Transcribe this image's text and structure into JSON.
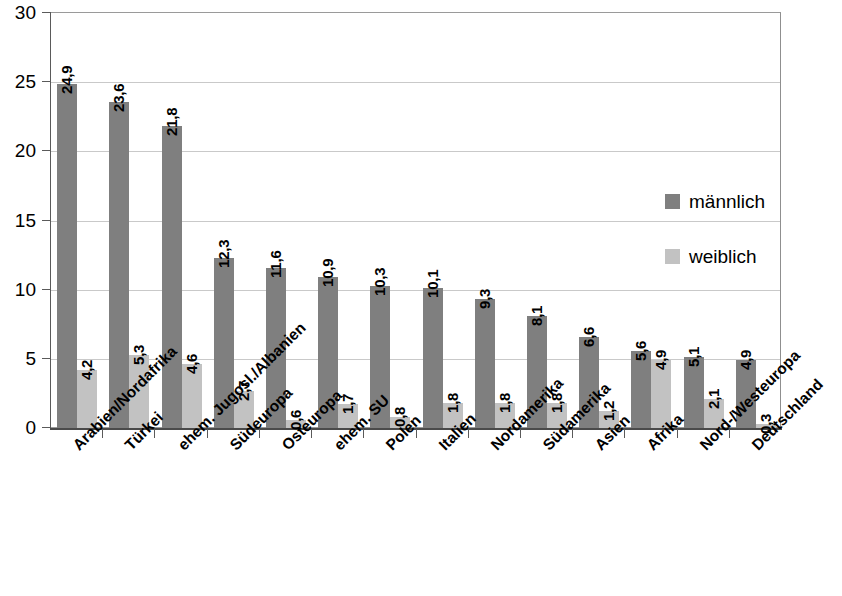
{
  "chart_data": {
    "type": "bar",
    "title": "",
    "subtitle": "",
    "xlabel": "",
    "ylabel": "",
    "ylim": [
      0,
      30
    ],
    "ytick_step": 5,
    "yticks": [
      "0",
      "5",
      "10",
      "15",
      "20",
      "25",
      "30"
    ],
    "grid": true,
    "legend_position": "inside-right",
    "decimal_separator": ",",
    "categories": [
      "Arabien/Nordafrika",
      "Türkei",
      "ehem. Jugosl./Albanien",
      "Südeuropa",
      "Osteuropa",
      "ehem. SU",
      "Polen",
      "Italien",
      "Nordamerika",
      "Südamerika",
      "Asien",
      "Afrika",
      "Nord-/Westeuropa",
      "Deutschland"
    ],
    "series": [
      {
        "name": "männlich",
        "color": "#7f7f7f",
        "values": [
          24.9,
          23.6,
          21.8,
          12.3,
          11.6,
          10.9,
          10.3,
          10.1,
          9.3,
          8.1,
          6.6,
          5.6,
          5.1,
          4.9
        ],
        "labels": [
          "24,9",
          "23,6",
          "21,8",
          "12,3",
          "11,6",
          "10,9",
          "10,3",
          "10,1",
          "9,3",
          "8,1",
          "6,6",
          "5,6",
          "5,1",
          "4,9"
        ]
      },
      {
        "name": "weiblich",
        "color": "#c2c2c2",
        "values": [
          4.2,
          5.3,
          4.6,
          2.7,
          0.6,
          1.7,
          0.8,
          1.8,
          1.8,
          1.8,
          1.2,
          4.9,
          2.1,
          0.3
        ],
        "labels": [
          "4,2",
          "5,3",
          "4,6",
          "2,7",
          "0,6",
          "1,7",
          "0,8",
          "1,8",
          "1,8",
          "1,8",
          "1,2",
          "4,9",
          "2,1",
          "0,3"
        ]
      }
    ]
  },
  "legend": {
    "items": [
      {
        "label": "männlich",
        "color": "#7f7f7f"
      },
      {
        "label": "weiblich",
        "color": "#c2c2c2"
      }
    ]
  }
}
